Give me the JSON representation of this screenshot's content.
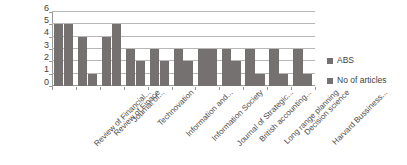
{
  "chart_data": {
    "type": "bar",
    "title": "",
    "subtitle": "",
    "xlabel": "",
    "ylabel": "",
    "ylim": [
      0,
      6
    ],
    "yticks": [
      0,
      1,
      2,
      3,
      4,
      5,
      6
    ],
    "grid": true,
    "legend_position": "right",
    "orientation": "vertical",
    "grouping": "clustered",
    "categories": [
      "Review of Financial...",
      "Review of Finace",
      "Journal of...",
      "Technovation",
      "Information and...",
      "Information Society",
      "Journal of Strategic...",
      "British accounting...",
      "Long range planning",
      "Decision science",
      "Harvard Bussiness..."
    ],
    "series": [
      {
        "name": "ABS",
        "color": "#767171",
        "values": [
          5,
          4,
          4,
          3,
          3,
          3,
          3,
          3,
          3,
          3,
          3
        ]
      },
      {
        "name": "No of articles",
        "color": "#767171",
        "values": [
          5,
          1,
          5,
          2,
          2,
          2,
          3,
          2,
          1,
          1,
          1
        ]
      }
    ]
  },
  "legend": {
    "entries": [
      {
        "label": "ABS",
        "color": "#767171"
      },
      {
        "label": "No of articles",
        "color": "#767171"
      }
    ]
  },
  "axis": {
    "y_tick_labels": [
      "6",
      "5",
      "4",
      "3",
      "2",
      "1",
      "0"
    ]
  }
}
